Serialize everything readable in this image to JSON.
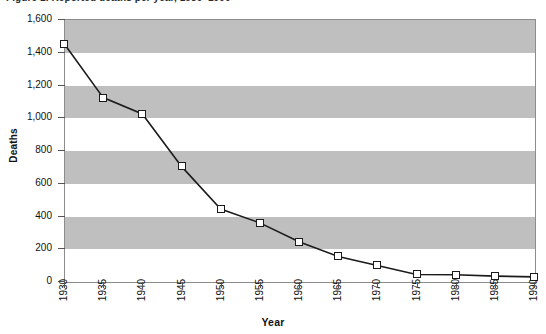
{
  "figure": {
    "caption": "Figure 1.  Reported deaths per year, 1930–1990"
  },
  "axes": {
    "y_title": "Deaths",
    "x_title": "Year",
    "y_ticks": [
      "0",
      "200",
      "400",
      "600",
      "800",
      "1,000",
      "1,200",
      "1,400",
      "1,600"
    ],
    "x_ticks": [
      "1930",
      "1935",
      "1940",
      "1945",
      "1950",
      "1955",
      "1960",
      "1965",
      "1970",
      "1975",
      "1980",
      "1985",
      "1990"
    ]
  },
  "style": {
    "band_color": "#bfbfbf",
    "line_color": "#1b1b1b",
    "marker_fill": "#ffffff",
    "frame_color": "#8c8c8c"
  },
  "chart_data": {
    "type": "line",
    "title": "Figure 1.  Reported deaths per year, 1930–1990",
    "xlabel": "Year",
    "ylabel": "Deaths",
    "x": [
      1930,
      1935,
      1940,
      1945,
      1950,
      1955,
      1960,
      1965,
      1970,
      1975,
      1980,
      1985,
      1990
    ],
    "values": [
      1450,
      1120,
      1020,
      700,
      440,
      355,
      240,
      150,
      95,
      40,
      38,
      30,
      25
    ],
    "categories": [
      "1930",
      "1935",
      "1940",
      "1945",
      "1950",
      "1955",
      "1960",
      "1965",
      "1970",
      "1975",
      "1980",
      "1985",
      "1990"
    ],
    "ylim": [
      0,
      1600
    ],
    "xlim": [
      1930,
      1990
    ],
    "ytick_step": 200,
    "xtick_step": 5,
    "grid": false,
    "banded_background": true,
    "bands": [
      [
        200,
        400
      ],
      [
        600,
        800
      ],
      [
        1000,
        1200
      ],
      [
        1400,
        1600
      ]
    ],
    "legend": null,
    "marker": "square-open",
    "series": [
      {
        "name": "Deaths",
        "values": [
          1450,
          1120,
          1020,
          700,
          440,
          355,
          240,
          150,
          95,
          40,
          38,
          30,
          25
        ]
      }
    ]
  }
}
